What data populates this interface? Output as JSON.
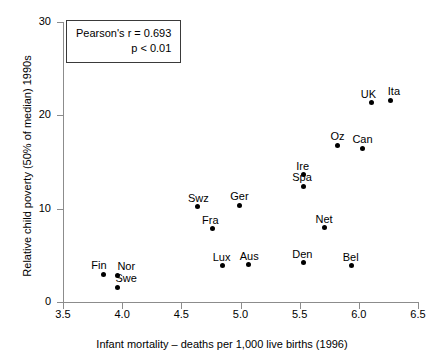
{
  "chart_data": {
    "type": "scatter",
    "title": "",
    "xlabel": "Infant mortality – deaths per 1,000 live births (1996)",
    "ylabel": "Relative child poverty (50% of median) 1990s",
    "xlim": [
      3.5,
      6.5
    ],
    "ylim": [
      0,
      30
    ],
    "xticks": [
      "3.5",
      "4.0",
      "4.5",
      "5.0",
      "5.5",
      "6.0",
      "6.5"
    ],
    "xtick_values": [
      3.5,
      4.0,
      4.5,
      5.0,
      5.5,
      6.0,
      6.5
    ],
    "yticks": [
      "0",
      "10",
      "20",
      "30"
    ],
    "ytick_values": [
      0,
      10,
      20,
      30
    ],
    "grid": false,
    "legend": "none",
    "marker_color": "#000000",
    "axis_color": "#8c8c8c",
    "annotation": {
      "line1": "Pearson's r = 0.693",
      "line2": "p < 0.01",
      "r_value": 0.693,
      "p_text": "p < 0.01"
    },
    "points": [
      {
        "label": "Fin",
        "x": 3.84,
        "y": 2.95,
        "lx": -12,
        "ly": -14
      },
      {
        "label": "Nor",
        "x": 3.96,
        "y": 2.84,
        "lx": 0,
        "ly": -14
      },
      {
        "label": "Swe",
        "x": 3.96,
        "y": 1.59,
        "lx": -2,
        "ly": -14
      },
      {
        "label": "Swz",
        "x": 4.64,
        "y": 10.23,
        "lx": -10,
        "ly": -14
      },
      {
        "label": "Ger",
        "x": 4.99,
        "y": 10.34,
        "lx": -9,
        "ly": -14
      },
      {
        "label": "Fra",
        "x": 4.76,
        "y": 7.84,
        "lx": -10,
        "ly": -14
      },
      {
        "label": "Lux",
        "x": 4.85,
        "y": 3.86,
        "lx": -10,
        "ly": -14
      },
      {
        "label": "Aus",
        "x": 5.07,
        "y": 3.98,
        "lx": -9,
        "ly": -14
      },
      {
        "label": "Den",
        "x": 5.53,
        "y": 4.2,
        "lx": -11,
        "ly": -14
      },
      {
        "label": "Bel",
        "x": 5.94,
        "y": 3.86,
        "lx": -9,
        "ly": -14
      },
      {
        "label": "Net",
        "x": 5.71,
        "y": 7.95,
        "lx": -9,
        "ly": -14
      },
      {
        "label": "Spa",
        "x": 5.53,
        "y": 12.39,
        "lx": -11,
        "ly": -14
      },
      {
        "label": "Ire",
        "x": 5.53,
        "y": 13.64,
        "lx": -7,
        "ly": -14
      },
      {
        "label": "Oz",
        "x": 5.82,
        "y": 16.82,
        "lx": -7,
        "ly": -14
      },
      {
        "label": "Can",
        "x": 6.03,
        "y": 16.48,
        "lx": -10,
        "ly": -14
      },
      {
        "label": "UK",
        "x": 6.11,
        "y": 21.36,
        "lx": -11,
        "ly": -14
      },
      {
        "label": "Ita",
        "x": 6.27,
        "y": 21.59,
        "lx": -3,
        "ly": -14
      }
    ]
  }
}
